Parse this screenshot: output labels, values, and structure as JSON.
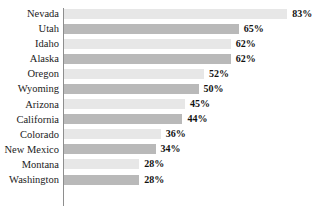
{
  "chart_data": {
    "type": "bar",
    "orientation": "horizontal",
    "title": "",
    "subtitle": "",
    "xlabel": "",
    "ylabel": "",
    "xlim": [
      0,
      100
    ],
    "grid": false,
    "legend": null,
    "value_suffix": "%",
    "categories": [
      "Nevada",
      "Utah",
      "Idaho",
      "Alaska",
      "Oregon",
      "Wyoming",
      "Arizona",
      "California",
      "Colorado",
      "New Mexico",
      "Montana",
      "Washington"
    ],
    "values": [
      83,
      65,
      62,
      62,
      52,
      50,
      45,
      44,
      36,
      34,
      28,
      28
    ],
    "data_labels": [
      "83%",
      "65%",
      "62%",
      "62%",
      "52%",
      "50%",
      "45%",
      "44%",
      "36%",
      "34%",
      "28%",
      "28%"
    ],
    "bar_colors": [
      "#e7e7e7",
      "#b9b9b9",
      "#e7e7e7",
      "#b9b9b9",
      "#e7e7e7",
      "#b9b9b9",
      "#e7e7e7",
      "#b9b9b9",
      "#e7e7e7",
      "#b9b9b9",
      "#e7e7e7",
      "#b9b9b9"
    ],
    "axis_color": "#8e8e8e",
    "background_color": "#ffffff",
    "label_color": "#1b1b1b"
  }
}
